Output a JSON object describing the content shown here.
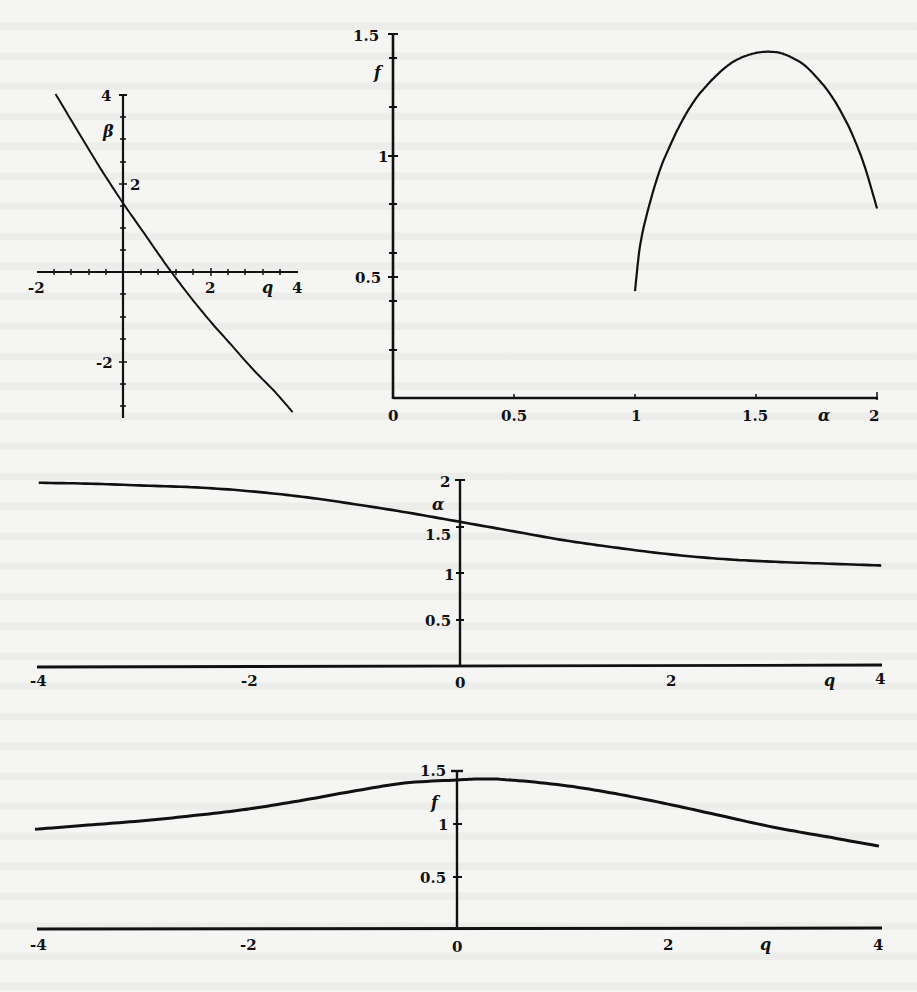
{
  "chart_data": [
    {
      "id": "beta_vs_q",
      "type": "line",
      "title": "",
      "xlabel": "q",
      "ylabel": "β",
      "xlim": [
        -2,
        4
      ],
      "ylim": [
        -3.2,
        4
      ],
      "xticks": [
        "-2",
        "2",
        "4"
      ],
      "yticks": [
        "4",
        "2",
        "-2"
      ],
      "grid": false,
      "series": [
        {
          "name": "β(q)",
          "x": [
            -1.55,
            -1.0,
            -0.5,
            0.0,
            0.5,
            1.0,
            1.5,
            2.0,
            2.5,
            3.0,
            3.5,
            3.9
          ],
          "y": [
            4.0,
            3.1,
            2.3,
            1.55,
            0.85,
            0.15,
            -0.5,
            -1.1,
            -1.65,
            -2.2,
            -2.7,
            -3.15
          ]
        }
      ]
    },
    {
      "id": "f_vs_alpha",
      "type": "line",
      "title": "",
      "xlabel": "α",
      "ylabel": "f",
      "xlim": [
        0,
        2
      ],
      "ylim": [
        0,
        1.5
      ],
      "xticks": [
        "0",
        "0.5",
        "1",
        "1.5",
        "2"
      ],
      "yticks": [
        "1.5",
        "1",
        "0.5"
      ],
      "grid": false,
      "series": [
        {
          "name": "f(α)",
          "x": [
            1.0,
            1.02,
            1.05,
            1.1,
            1.15,
            1.2,
            1.25,
            1.3,
            1.35,
            1.4,
            1.45,
            1.5,
            1.55,
            1.6,
            1.65,
            1.7,
            1.75,
            1.8,
            1.85,
            1.9,
            1.95,
            2.0
          ],
          "y": [
            0.44,
            0.62,
            0.76,
            0.93,
            1.05,
            1.15,
            1.23,
            1.29,
            1.34,
            1.38,
            1.405,
            1.42,
            1.425,
            1.42,
            1.4,
            1.37,
            1.32,
            1.26,
            1.18,
            1.08,
            0.95,
            0.78
          ]
        }
      ]
    },
    {
      "id": "alpha_vs_q",
      "type": "line",
      "title": "",
      "xlabel": "q",
      "ylabel": "α",
      "xlim": [
        -4,
        4
      ],
      "ylim": [
        0,
        2
      ],
      "xticks": [
        "-4",
        "-2",
        "0",
        "2",
        "4"
      ],
      "yticks": [
        "2",
        "1.5",
        "1",
        "0.5"
      ],
      "grid": false,
      "series": [
        {
          "name": "α(q)",
          "x": [
            -4,
            -3.5,
            -3,
            -2.5,
            -2,
            -1.5,
            -1,
            -0.5,
            0,
            0.5,
            1,
            1.5,
            2,
            2.5,
            3,
            3.5,
            4
          ],
          "y": [
            1.97,
            1.96,
            1.94,
            1.92,
            1.88,
            1.82,
            1.74,
            1.65,
            1.55,
            1.45,
            1.35,
            1.27,
            1.2,
            1.15,
            1.12,
            1.1,
            1.08
          ]
        }
      ]
    },
    {
      "id": "f_vs_q",
      "type": "line",
      "title": "",
      "xlabel": "q",
      "ylabel": "f",
      "xlim": [
        -4,
        4
      ],
      "ylim": [
        0,
        1.5
      ],
      "xticks": [
        "-4",
        "-2",
        "0",
        "2",
        "4"
      ],
      "yticks": [
        "1.5",
        "1",
        "0.5"
      ],
      "grid": false,
      "series": [
        {
          "name": "f(q)",
          "x": [
            -4,
            -3.5,
            -3,
            -2.5,
            -2,
            -1.5,
            -1,
            -0.5,
            0,
            0.25,
            0.5,
            1,
            1.5,
            2,
            2.5,
            3,
            3.5,
            4
          ],
          "y": [
            0.94,
            0.98,
            1.02,
            1.07,
            1.13,
            1.21,
            1.3,
            1.38,
            1.41,
            1.42,
            1.41,
            1.36,
            1.28,
            1.18,
            1.07,
            0.96,
            0.87,
            0.78
          ]
        }
      ]
    }
  ],
  "labels": {
    "p1": {
      "xvar": "q",
      "yvar": "β",
      "x_ticks": [
        "-2",
        "2",
        "4"
      ],
      "y_ticks": [
        "4",
        "2",
        "-2"
      ]
    },
    "p2": {
      "xvar": "α",
      "yvar": "f",
      "x_ticks": [
        "0",
        "0.5",
        "1",
        "1.5",
        "2"
      ],
      "y_ticks": [
        "1.5",
        "1",
        "0.5"
      ]
    },
    "p3": {
      "xvar": "q",
      "yvar": "α",
      "x_ticks": [
        "-4",
        "-2",
        "0",
        "2",
        "4"
      ],
      "y_ticks": [
        "2",
        "1.5",
        "1",
        "0.5"
      ]
    },
    "p4": {
      "xvar": "q",
      "yvar": "f",
      "x_ticks": [
        "-4",
        "-2",
        "0",
        "2",
        "4"
      ],
      "y_ticks": [
        "1.5",
        "1",
        "0.5"
      ]
    }
  },
  "style": {
    "ink": "#111111",
    "paper": "#f5f5f3"
  }
}
